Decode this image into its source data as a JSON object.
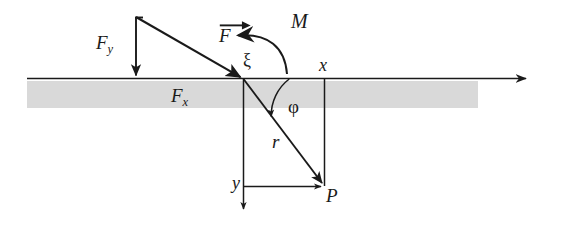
{
  "figure": {
    "kind": "force-moment-diagram",
    "background_color": "#ffffff",
    "ink_color": "#1a1a1a",
    "band_color": "#d9d9d9",
    "width": 562,
    "height": 225
  },
  "labels": {
    "force_vector": "F",
    "force_y": "F",
    "force_y_sub": "y",
    "force_x": "F",
    "force_x_sub": "x",
    "moment": "M",
    "xi": "ξ",
    "phi": "φ",
    "radius": "r",
    "axis_x": "x",
    "axis_y": "y",
    "point_p": "P"
  },
  "geometry": {
    "origin": {
      "x": 243,
      "y": 79
    },
    "point_p": {
      "x": 324,
      "y": 185
    },
    "axis_line": {
      "x1": 27,
      "y1": 78,
      "x2": 533,
      "y2": 78
    },
    "band": {
      "x": 27,
      "y": 81,
      "width": 451,
      "height": 27
    },
    "force_start": {
      "x": 136,
      "y": 17
    },
    "force_end": {
      "x": 243,
      "y": 79
    },
    "fy_arrow": {
      "x1": 136,
      "y1": 17,
      "x2": 136,
      "y2": 78
    },
    "x_drop_line": {
      "x": 324,
      "y1": 78,
      "y2": 185
    },
    "y_drop_line": {
      "x": 243,
      "y1": 79,
      "y2": 212
    },
    "y_horizontal_line": {
      "x1": 243,
      "y1": 186,
      "x2": 324,
      "y2": 186
    },
    "moment_arc": {
      "start_x": 286,
      "start_y": 73,
      "end_x": 233,
      "end_y": 36
    },
    "phi_arc_radius": 46
  },
  "label_positions": {
    "force_vector": {
      "left": 219,
      "top": 26,
      "size": 19
    },
    "force_y": {
      "left": 96,
      "top": 33,
      "size": 19
    },
    "force_x": {
      "left": 171,
      "top": 86,
      "size": 19
    },
    "moment": {
      "left": 291,
      "top": 11,
      "size": 19
    },
    "xi": {
      "left": 243,
      "top": 52,
      "size": 18
    },
    "phi": {
      "left": 288,
      "top": 97,
      "size": 18
    },
    "radius": {
      "left": 272,
      "top": 132,
      "size": 19
    },
    "axis_x": {
      "left": 319,
      "top": 57,
      "size": 18
    },
    "axis_y": {
      "left": 232,
      "top": 175,
      "size": 18
    },
    "point_p": {
      "left": 326,
      "top": 186,
      "size": 19
    }
  }
}
